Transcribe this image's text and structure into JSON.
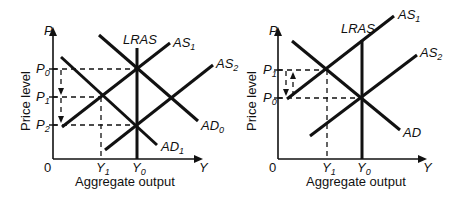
{
  "diagrams": [
    {
      "id": "left",
      "y_axis_label": "Price level",
      "y_axis_symbol": "P",
      "x_axis_symbol": "Y",
      "x_axis_label": "Aggregate output",
      "origin": "0",
      "price_levels": [
        {
          "name": "P",
          "sub": "0"
        },
        {
          "name": "P",
          "sub": "1"
        },
        {
          "name": "P",
          "sub": "2"
        }
      ],
      "output_levels": [
        {
          "name": "Y",
          "sub": "1"
        },
        {
          "name": "Y",
          "sub": "0"
        }
      ],
      "curves": {
        "lras": "LRAS",
        "as1": {
          "name": "AS",
          "sub": "1"
        },
        "as2": {
          "name": "AS",
          "sub": "2"
        },
        "ad0": {
          "name": "AD",
          "sub": "0"
        },
        "ad1": {
          "name": "AD",
          "sub": "1"
        }
      },
      "arrows": "Price level falls P0 → P1 → P2"
    },
    {
      "id": "right",
      "y_axis_label": "Price level",
      "y_axis_symbol": "P",
      "x_axis_symbol": "Y",
      "x_axis_label": "Aggregate output",
      "origin": "0",
      "price_levels": [
        {
          "name": "P",
          "sub": "1"
        },
        {
          "name": "P",
          "sub": "0"
        }
      ],
      "output_levels": [
        {
          "name": "Y",
          "sub": "1"
        },
        {
          "name": "Y",
          "sub": "0"
        }
      ],
      "curves": {
        "lras": "LRAS",
        "as1": {
          "name": "AS",
          "sub": "1"
        },
        "as2": {
          "name": "AS",
          "sub": "2"
        },
        "ad": {
          "name": "AD",
          "sub": ""
        }
      },
      "arrows": "Price level moves between P0 and P1 (up and down)"
    }
  ]
}
